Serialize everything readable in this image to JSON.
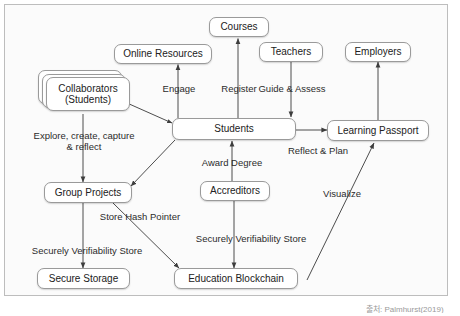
{
  "diagram": {
    "nodes": [
      {
        "id": "courses",
        "label": "Courses"
      },
      {
        "id": "online",
        "label": "Online Resources"
      },
      {
        "id": "teachers",
        "label": "Teachers"
      },
      {
        "id": "employers",
        "label": "Employers"
      },
      {
        "id": "collaborators",
        "label": "Collaborators\n(Students)",
        "line1": "Collaborators",
        "line2": "(Students)"
      },
      {
        "id": "students",
        "label": "Students"
      },
      {
        "id": "passport",
        "label": "Learning Passport"
      },
      {
        "id": "groupprojects",
        "label": "Group Projects"
      },
      {
        "id": "accreditors",
        "label": "Accreditors"
      },
      {
        "id": "securestorage",
        "label": "Secure Storage"
      },
      {
        "id": "blockchain",
        "label": "Education Blockchain"
      }
    ],
    "edges": [
      {
        "from": "students",
        "to": "online",
        "label": "Engage"
      },
      {
        "from": "students",
        "to": "courses",
        "label": "Register"
      },
      {
        "from": "teachers",
        "to": "students",
        "label": "Guide & Assess"
      },
      {
        "from": "collaborators",
        "to": "students",
        "label": "",
        "bidirectional": true
      },
      {
        "from": "collaborators",
        "to": "groupprojects",
        "label": "Explore, create, capture & reflect",
        "line1": "Explore, create, capture",
        "line2": "& reflect"
      },
      {
        "from": "students",
        "to": "groupprojects",
        "label": ""
      },
      {
        "from": "accreditors",
        "to": "students",
        "label": "Award Degree"
      },
      {
        "from": "students",
        "to": "passport",
        "label": "Reflect & Plan"
      },
      {
        "from": "passport",
        "to": "employers",
        "label": ""
      },
      {
        "from": "groupprojects",
        "to": "securestorage",
        "label": "Securely Verifiability Store"
      },
      {
        "from": "groupprojects",
        "to": "blockchain",
        "label": "Store Hash Pointer"
      },
      {
        "from": "accreditors",
        "to": "blockchain",
        "label": "Securely Verifiability Store"
      },
      {
        "from": "blockchain",
        "to": "passport",
        "label": "Visualize"
      }
    ],
    "edge_labels": {
      "engage": "Engage",
      "register": "Register",
      "guide_assess": "Guide & Assess",
      "explore_line1": "Explore, create, capture",
      "explore_line2": "& reflect",
      "award_degree": "Award Degree",
      "reflect_plan": "Reflect & Plan",
      "store_hash_pointer": "Store Hash Pointer",
      "securely_store_left": "Securely Verifiability Store",
      "securely_store_right": "Securely Verifiability Store",
      "visualize": "Visualize"
    },
    "caption": "출처: Palmhurst(2019)",
    "colors": {
      "background": "#fbfbfb",
      "frame_border": "#bdbdbd",
      "node_border": "#9a9a9a",
      "node_fill": "#ffffff",
      "edge": "#4d4d4d",
      "text": "#222222"
    }
  }
}
